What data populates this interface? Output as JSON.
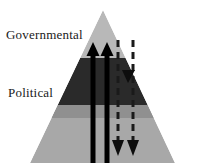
{
  "figure": {
    "type": "pyramid-diagram",
    "background_color": "#ffffff"
  },
  "pyramid": {
    "apex": {
      "x": 103,
      "y": 10
    },
    "base_left": {
      "x": 30,
      "y": 163
    },
    "base_right": {
      "x": 175,
      "y": 163
    },
    "bands": [
      {
        "name": "top-band",
        "label": "Governmental",
        "color": "#b8b8b8",
        "top_y": 10,
        "bottom_y": 58
      },
      {
        "name": "middle-band",
        "label": "Political",
        "color": "#2a2a2a",
        "top_y": 58,
        "bottom_y": 105
      },
      {
        "name": "bottom-band",
        "label": "",
        "color": "#a8a8a8",
        "top_y": 105,
        "bottom_y": 163
      }
    ],
    "shadow_strip": {
      "color": "#909090",
      "top_y": 105,
      "bottom_y": 118
    }
  },
  "labels": {
    "governmental": "Governmental",
    "political": "Political"
  },
  "arrows": {
    "upward": [
      {
        "name": "solid-up-arrow-left",
        "x": 93,
        "tip_y": 42,
        "tail_y": 163,
        "style": "solid",
        "color": "#000000",
        "shaft_width": 5,
        "head_width": 13,
        "head_height": 14
      },
      {
        "name": "solid-up-arrow-right",
        "x": 107,
        "tip_y": 42,
        "tail_y": 163,
        "style": "solid",
        "color": "#000000",
        "shaft_width": 5,
        "head_width": 13,
        "head_height": 14
      }
    ],
    "downward": [
      {
        "name": "dashed-down-arrow-left",
        "x": 118,
        "tail_y": 40,
        "tip_y": 156,
        "style": "dashed",
        "color": "#1a1a1a",
        "shaft_width": 3,
        "head_width": 12,
        "head_height": 16,
        "dash_pattern": "7,5"
      },
      {
        "name": "dashed-down-arrow-right",
        "x": 133,
        "tail_y": 40,
        "tip_y": 156,
        "style": "dashed",
        "color": "#1a1a1a",
        "shaft_width": 3,
        "head_width": 12,
        "head_height": 16,
        "dash_pattern": "7,5"
      }
    ],
    "interior": [
      {
        "name": "dashed-down-arrowhead-midband",
        "x": 128,
        "tip_y": 83,
        "head_width": 13,
        "head_height": 13,
        "color": "#0d0d0d"
      }
    ]
  }
}
